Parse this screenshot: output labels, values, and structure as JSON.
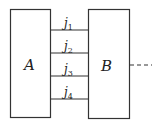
{
  "diagram": {
    "left_box": {
      "label": "A"
    },
    "right_box": {
      "label": "B"
    },
    "junctions": [
      {
        "label": "j",
        "sub": "1"
      },
      {
        "label": "j",
        "sub": "2"
      },
      {
        "label": "j",
        "sub": "3"
      },
      {
        "label": "j",
        "sub": "4"
      }
    ],
    "continuation": "dashed-line"
  }
}
